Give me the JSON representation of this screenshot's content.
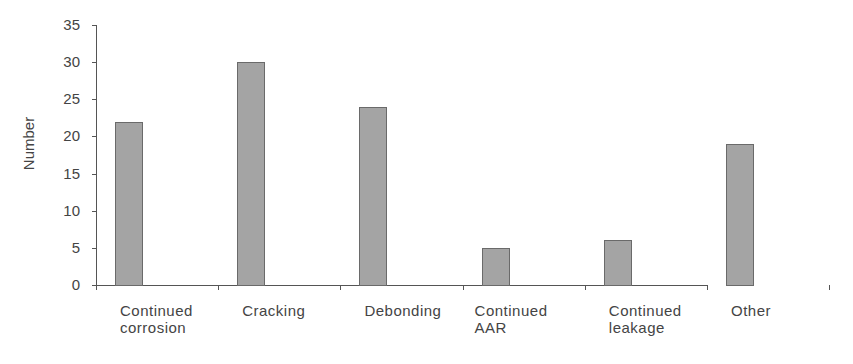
{
  "chart_data": {
    "type": "bar",
    "title": "",
    "xlabel": "",
    "ylabel": "Number",
    "ylim": [
      0,
      35
    ],
    "yticks": [
      0,
      5,
      10,
      15,
      20,
      25,
      30,
      35
    ],
    "grid": false,
    "legend": null,
    "categories": [
      "Continued corrosion",
      "Cracking",
      "Debonding",
      "Continued AAR",
      "Continued leakage",
      "Other"
    ],
    "category_labels": [
      [
        "Continued",
        "corrosion"
      ],
      [
        "Cracking"
      ],
      [
        "Debonding"
      ],
      [
        "Continued",
        "AAR"
      ],
      [
        "Continued",
        "leakage"
      ],
      [
        "Other"
      ]
    ],
    "values": [
      22,
      30,
      24,
      5,
      6,
      19
    ],
    "colors": {
      "bar_fill": "#a4a4a4",
      "bar_edge": "#6a6a6a",
      "axis": "#555555"
    }
  }
}
